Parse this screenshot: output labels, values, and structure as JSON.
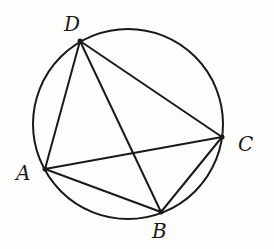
{
  "diagram": {
    "type": "cyclic-quadrilateral",
    "circle": {
      "cx": 128,
      "cy": 124,
      "r": 95
    },
    "points": [
      {
        "name": "A",
        "x": 45,
        "y": 169,
        "lx": 16,
        "ly": 180
      },
      {
        "name": "B",
        "x": 161,
        "y": 212,
        "lx": 152,
        "ly": 238
      },
      {
        "name": "C",
        "x": 222,
        "y": 137,
        "lx": 238,
        "ly": 150
      },
      {
        "name": "D",
        "x": 80,
        "y": 41,
        "lx": 64,
        "ly": 30
      }
    ],
    "segments": [
      [
        "A",
        "D"
      ],
      [
        "D",
        "C"
      ],
      [
        "C",
        "B"
      ],
      [
        "B",
        "A"
      ],
      [
        "A",
        "C"
      ],
      [
        "D",
        "B"
      ]
    ],
    "stroke_color": "#1a1a1a",
    "labels": {
      "A": "A",
      "B": "B",
      "C": "C",
      "D": "D"
    }
  }
}
